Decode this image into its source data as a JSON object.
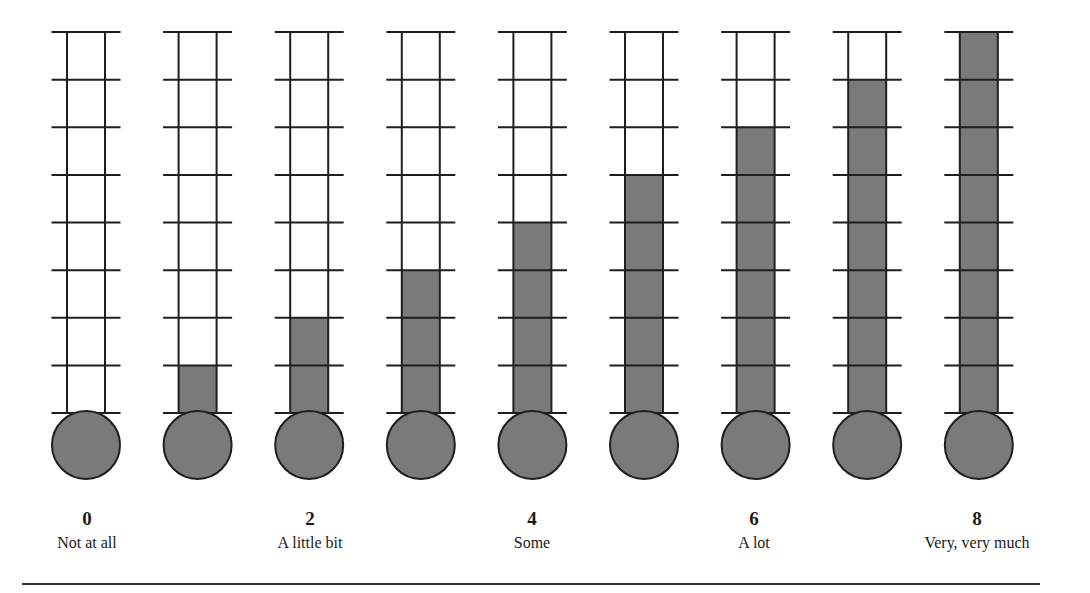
{
  "chart_data": {
    "type": "bar",
    "title": "",
    "categories": [
      "0",
      "1",
      "2",
      "3",
      "4",
      "5",
      "6",
      "7",
      "8"
    ],
    "values": [
      0,
      1,
      2,
      3,
      4,
      5,
      6,
      7,
      8
    ],
    "ylim": [
      0,
      8
    ],
    "segments_per_thermometer": 8,
    "xlabel": "",
    "ylabel": "",
    "grid": true,
    "legend": null,
    "anchors": [
      {
        "value": 0,
        "label": "Not at all"
      },
      {
        "value": 2,
        "label": "A little bit"
      },
      {
        "value": 4,
        "label": "Some"
      },
      {
        "value": 6,
        "label": "A lot"
      },
      {
        "value": 8,
        "label": "Very, very much"
      }
    ]
  },
  "colors": {
    "fill": "#7a7a7a",
    "line": "#1e1e1e",
    "background": "#ffffff"
  },
  "labels": [
    {
      "num": "0",
      "text": "Not at all"
    },
    {
      "num": "2",
      "text": "A little bit"
    },
    {
      "num": "4",
      "text": "Some"
    },
    {
      "num": "6",
      "text": "A lot"
    },
    {
      "num": "8",
      "text": "Very, very much"
    }
  ]
}
